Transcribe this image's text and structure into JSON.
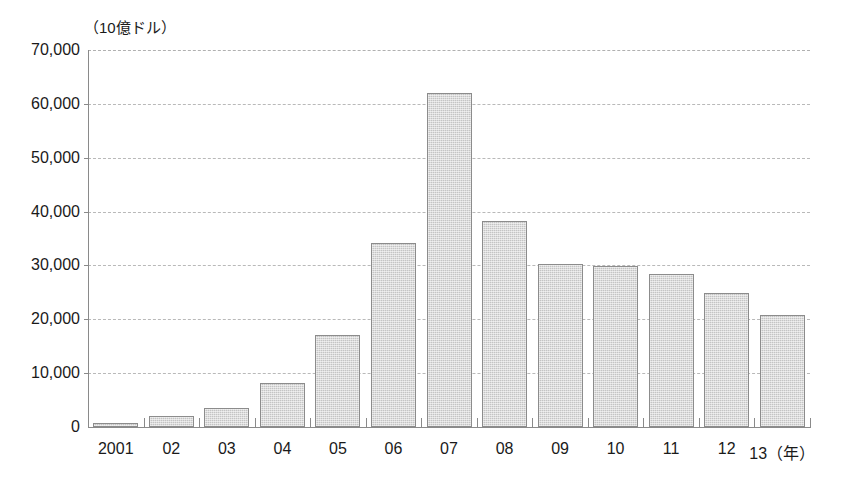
{
  "chart_data": {
    "type": "bar",
    "title": "",
    "subtitle": "",
    "unit_label": "（10億ドル）",
    "xlabel_suffix": "（年）",
    "xlabel": "",
    "ylabel": "",
    "ylim": [
      0,
      70000
    ],
    "ytick_step": 10000,
    "grid": true,
    "legend": "none",
    "categories": [
      "2001",
      "02",
      "03",
      "04",
      "05",
      "06",
      "07",
      "08",
      "09",
      "10",
      "11",
      "12",
      "13"
    ],
    "category_labels": [
      "2001",
      "02",
      "03",
      "04",
      "05",
      "06",
      "07",
      "08",
      "09",
      "10",
      "11",
      "12",
      "13（年）"
    ],
    "values": [
      800,
      2000,
      3600,
      8200,
      17000,
      34200,
      62000,
      38300,
      30300,
      29900,
      28400,
      24800,
      20800
    ],
    "ytick_labels": [
      "70,000",
      "60,000",
      "50,000",
      "40,000",
      "30,000",
      "20,000",
      "10,000",
      "0"
    ],
    "ytick_values": [
      70000,
      60000,
      50000,
      40000,
      30000,
      20000,
      10000,
      0
    ],
    "colors": {
      "bar_fill": "#c4c4c4",
      "bar_border": "#8c8c8c",
      "gridline": "#b9b9b9",
      "axis": "#8a8a8a",
      "text": "#1a1a1a",
      "background": "#ffffff"
    }
  }
}
